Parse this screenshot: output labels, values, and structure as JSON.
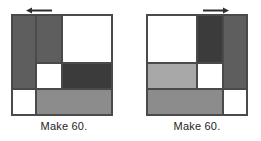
{
  "page": {
    "background": "#ffffff",
    "figure_type": "two-mirrored-square-tiling-puzzles"
  },
  "palette": {
    "white": "#ffffff",
    "light_gray": "#a8a8a8",
    "medium_gray": "#8c8c8c",
    "dark_gray": "#5e5e5e",
    "darkest_gray": "#3b3b3b",
    "outline": "#4a4a4a",
    "text": "#1d1d1d"
  },
  "panels": [
    {
      "id": "left-panel",
      "arrow": {
        "name": "arrow-left-icon",
        "direction": "left"
      },
      "caption": "Make 60.",
      "cells": [
        {
          "name": "cell-left-column",
          "x": 0,
          "y": 0,
          "w": 24,
          "h": 74,
          "fill": "#5e5e5e"
        },
        {
          "name": "cell-second-column",
          "x": 24,
          "y": 0,
          "w": 26,
          "h": 48,
          "fill": "#5e5e5e"
        },
        {
          "name": "cell-top-right-white",
          "x": 50,
          "y": 0,
          "w": 50,
          "h": 48,
          "fill": "#ffffff"
        },
        {
          "name": "cell-middle-white",
          "x": 24,
          "y": 48,
          "w": 26,
          "h": 26,
          "fill": "#ffffff"
        },
        {
          "name": "cell-middle-dark",
          "x": 50,
          "y": 48,
          "w": 50,
          "h": 26,
          "fill": "#3b3b3b"
        },
        {
          "name": "cell-bottom-left-white",
          "x": 0,
          "y": 74,
          "w": 24,
          "h": 26,
          "fill": "#ffffff"
        },
        {
          "name": "cell-bottom-strip",
          "x": 24,
          "y": 74,
          "w": 76,
          "h": 26,
          "fill": "#8c8c8c"
        }
      ]
    },
    {
      "id": "right-panel",
      "arrow": {
        "name": "arrow-right-icon",
        "direction": "right"
      },
      "caption": "Make 60.",
      "cells": [
        {
          "name": "cell-top-left-white",
          "x": 0,
          "y": 0,
          "w": 50,
          "h": 48,
          "fill": "#ffffff"
        },
        {
          "name": "cell-top-dark-block",
          "x": 50,
          "y": 0,
          "w": 26,
          "h": 48,
          "fill": "#3b3b3b"
        },
        {
          "name": "cell-right-column",
          "x": 76,
          "y": 0,
          "w": 24,
          "h": 74,
          "fill": "#5e5e5e"
        },
        {
          "name": "cell-middle-light-band",
          "x": 0,
          "y": 48,
          "w": 50,
          "h": 26,
          "fill": "#a8a8a8"
        },
        {
          "name": "cell-middle-white",
          "x": 50,
          "y": 48,
          "w": 26,
          "h": 26,
          "fill": "#ffffff"
        },
        {
          "name": "cell-bottom-strip",
          "x": 0,
          "y": 74,
          "w": 76,
          "h": 26,
          "fill": "#8c8c8c"
        },
        {
          "name": "cell-bottom-right-white",
          "x": 76,
          "y": 74,
          "w": 24,
          "h": 26,
          "fill": "#ffffff"
        }
      ]
    }
  ]
}
